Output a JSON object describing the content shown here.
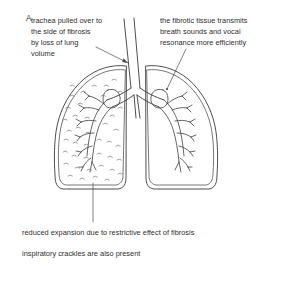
{
  "figure": {
    "panel_label": "A",
    "background_color": "#ffffff",
    "stroke_color": "#3a3a3a",
    "text_color": "#2e2e2e",
    "fibrosis_mark_color": "#6a6a6a"
  },
  "annotations": {
    "trachea_note": {
      "name": "trachea-deviation-note",
      "lines": [
        "trachea pulled over to",
        "the side of fibrosis",
        "by loss of lung",
        "volume"
      ]
    },
    "fibrotic_note": {
      "name": "fibrotic-transmission-note",
      "lines": [
        "the fibrotic tissue transmits",
        "breath sounds and vocal",
        "resonance more efficiently"
      ]
    }
  },
  "captions": {
    "expansion_note": "reduced expansion due to restrictive effect of fibrosis",
    "crackles_note": "inspiratory crackles are also present"
  },
  "diagram_parts": {
    "trachea": "trachea",
    "carina": "carina",
    "left_lung": "fibrotic-lung",
    "right_lung": "normal-lung",
    "left_bronchial_tree": "left-bronchial-tree",
    "right_bronchial_tree": "right-bronchial-tree",
    "fibrosis_texture": "fibrosis-stippling"
  }
}
